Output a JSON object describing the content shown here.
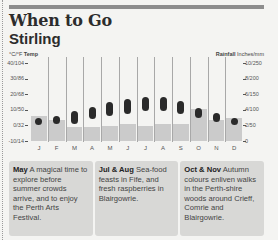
{
  "header": {
    "title": "When to Go",
    "subtitle": "Stirling"
  },
  "chart": {
    "left_unit_prefix": "°C/°F",
    "left_unit_label": "Temp",
    "right_unit_label": "Rainfall",
    "right_unit_suffix": "Inches/mm",
    "left_ticks": [
      "40/104",
      "30/86",
      "20/68",
      "10/50",
      "0/32",
      "-10/14"
    ],
    "right_ticks": [
      "10/250",
      "8/200",
      "6/150",
      "4/100",
      "2/50",
      "0"
    ],
    "months": [
      "J",
      "F",
      "M",
      "A",
      "M",
      "J",
      "J",
      "A",
      "S",
      "O",
      "N",
      "D"
    ],
    "colors": {
      "rain_bar": "#cbcbcb",
      "temp_dot": "#2a2a2a",
      "separator": "#a8a8a8"
    }
  },
  "chart_data": {
    "type": "bar",
    "categories": [
      "Jan",
      "Feb",
      "Mar",
      "Apr",
      "May",
      "Jun",
      "Jul",
      "Aug",
      "Sep",
      "Oct",
      "Nov",
      "Dec"
    ],
    "series": [
      {
        "name": "Rainfall (inches)",
        "type": "bar",
        "axis": "right",
        "values": [
          3.2,
          2.7,
          1.8,
          1.8,
          1.9,
          2.2,
          1.9,
          2.2,
          2.2,
          4.1,
          2.7,
          2.9
        ]
      },
      {
        "name": "Temp min (°C)",
        "type": "range",
        "axis": "left",
        "values": [
          2,
          2,
          2,
          5,
          7,
          8,
          10,
          10,
          8,
          6,
          3,
          2
        ]
      },
      {
        "name": "Temp max (°C)",
        "type": "range",
        "axis": "left",
        "values": [
          4,
          5,
          8,
          11,
          14,
          16,
          17,
          17,
          15,
          10,
          7,
          4
        ]
      }
    ],
    "xlabel": "",
    "ylabel_left": "°C/°F Temp",
    "ylabel_right": "Rainfall Inches/mm",
    "ylim_left": [
      -10,
      40
    ],
    "ylim_right": [
      0,
      10
    ],
    "grid": false,
    "legend": "none"
  },
  "highlights": [
    {
      "lead": "May",
      "text": " A magical time to explore before summer crowds arrive, and to enjoy the Perth Arts Festival."
    },
    {
      "lead": "Jul & Aug",
      "text": " Sea-food feasts in Fife, and fresh raspberries in Blairgowrie."
    },
    {
      "lead": "Oct & Nov",
      "text": " Autumn colours enliven walks in the Perth-shire woods around Crieff, Comrie and Blairgowrie."
    }
  ]
}
